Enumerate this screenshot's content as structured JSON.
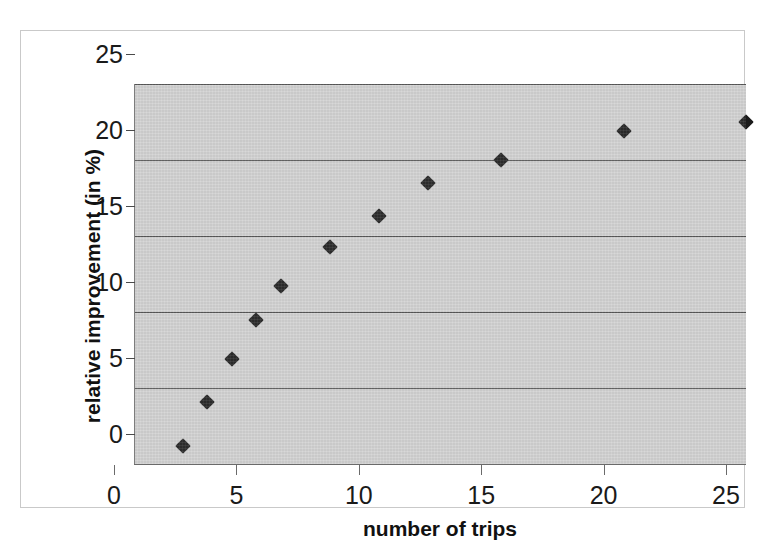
{
  "chart_data": {
    "type": "scatter",
    "title": "",
    "xlabel": "number of trips",
    "ylabel": "relative improvement  (in %)",
    "xlim": [
      0,
      25
    ],
    "ylim": [
      0,
      25
    ],
    "xticks": [
      "0",
      "5",
      "10",
      "15",
      "20",
      "25"
    ],
    "xtick_values": [
      0,
      5,
      10,
      15,
      20,
      25
    ],
    "yticks": [
      "0",
      "5",
      "10",
      "15",
      "20",
      "25"
    ],
    "ytick_values": [
      0,
      5,
      10,
      15,
      20,
      25
    ],
    "grid": "horizontal",
    "legend": "none",
    "plot_background": "#d0d0d0",
    "marker": "diamond",
    "marker_color": "#1b1b1b",
    "x": [
      2,
      3,
      4,
      5,
      6,
      8,
      10,
      12,
      15,
      20,
      25
    ],
    "values": [
      1.2,
      4.1,
      6.9,
      9.5,
      11.7,
      14.3,
      16.3,
      18.5,
      20.0,
      21.9,
      22.5
    ],
    "points": [
      {
        "x": 2,
        "y": 1.2
      },
      {
        "x": 3,
        "y": 4.1
      },
      {
        "x": 4,
        "y": 6.9
      },
      {
        "x": 5,
        "y": 9.5
      },
      {
        "x": 6,
        "y": 11.7
      },
      {
        "x": 8,
        "y": 14.3
      },
      {
        "x": 10,
        "y": 16.3
      },
      {
        "x": 12,
        "y": 18.5
      },
      {
        "x": 15,
        "y": 20.0
      },
      {
        "x": 20,
        "y": 21.9
      },
      {
        "x": 25,
        "y": 22.5
      }
    ]
  },
  "axes": {
    "y_title": "relative improvement  (in %)",
    "x_title": "number of trips",
    "y_labels": [
      "25",
      "20",
      "15",
      "10",
      "5",
      "0"
    ],
    "x_labels": [
      "0",
      "5",
      "10",
      "15",
      "20",
      "25"
    ]
  }
}
